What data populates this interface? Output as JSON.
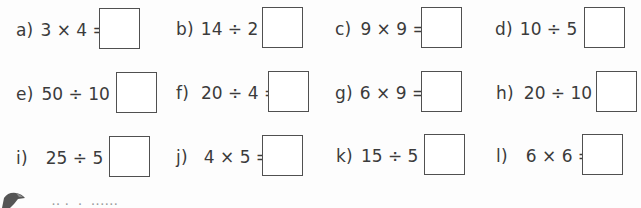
{
  "worksheet": {
    "problems": [
      {
        "label": "a)",
        "expression": "3 × 4 =",
        "answer": ""
      },
      {
        "label": "b)",
        "expression": "14 ÷ 2 =",
        "answer": ""
      },
      {
        "label": "c)",
        "expression": "9 × 9 =",
        "answer": ""
      },
      {
        "label": "d)",
        "expression": "10 ÷ 5 =",
        "answer": ""
      },
      {
        "label": "e)",
        "expression": "50 ÷ 10 =",
        "answer": ""
      },
      {
        "label": "f)",
        "expression": "20 ÷ 4 =",
        "answer": ""
      },
      {
        "label": "g)",
        "expression": "6 × 9 =",
        "answer": ""
      },
      {
        "label": "h)",
        "expression": "20 ÷ 10 =",
        "answer": ""
      },
      {
        "label": "i)",
        "expression": "25 ÷ 5 =",
        "answer": ""
      },
      {
        "label": "j)",
        "expression": "4 × 5 =",
        "answer": ""
      },
      {
        "label": "k)",
        "expression": "15 ÷ 5 =",
        "answer": ""
      },
      {
        "label": "l)",
        "expression": "6 × 6 =",
        "answer": ""
      }
    ],
    "footer": {
      "icon": "pencil-icon",
      "text": "·· ·  ·  ······"
    },
    "colors": {
      "text": "#3b3b3b",
      "box_border": "#505050",
      "background": "#fdfdfd"
    }
  }
}
